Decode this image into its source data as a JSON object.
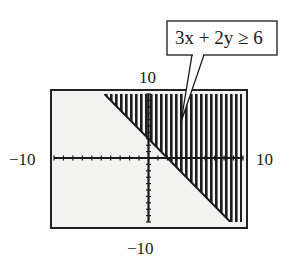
{
  "chart_data": {
    "type": "area",
    "title": "",
    "inequality": "3x + 2y ≥ 6",
    "boundary_line": {
      "equation": "3x + 2y = 6",
      "slope": -1.5,
      "y_intercept": 3,
      "x_intercept": 2,
      "style": "solid"
    },
    "shaded_region": "above-right of line (3x + 2y ≥ 6)",
    "xlim": [
      -10,
      10
    ],
    "ylim": [
      -10,
      10
    ],
    "xscale": 1,
    "yscale": 1,
    "grid": false,
    "window_labels": {
      "xmin": "−10",
      "xmax": "10",
      "ymin": "−10",
      "ymax": "10"
    },
    "annotation": {
      "text": "3x + 2y ≥ 6",
      "points_to": "shaded region"
    }
  },
  "labels": {
    "xmin": "−10",
    "xmax": "10",
    "ymin": "−10",
    "ymax": "10",
    "callout": "3x + 2y ≥ 6"
  },
  "colors": {
    "screen_bg": "#f2f2f0",
    "ink": "#1a1a1a",
    "frame": "#222222"
  }
}
